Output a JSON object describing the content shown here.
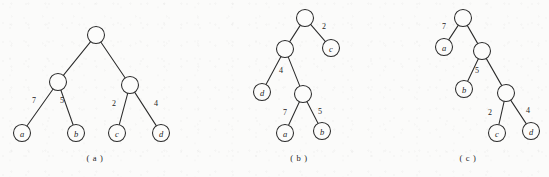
{
  "figure": {
    "type": "binary-tree-diagram",
    "background_color": "#fbfbfa",
    "ink_color": "#2b2b2b",
    "node_radius": 8.5,
    "subfigures": [
      {
        "id": "a",
        "caption": "( a )",
        "caption_pos": {
          "x": 95,
          "y": 158
        },
        "nodes": [
          {
            "id": "a-root",
            "label": "",
            "x": 96,
            "y": 35,
            "kind": "internal"
          },
          {
            "id": "a-n1",
            "label": "",
            "x": 58,
            "y": 82,
            "kind": "internal"
          },
          {
            "id": "a-n2",
            "label": "",
            "x": 130,
            "y": 85,
            "kind": "internal"
          },
          {
            "id": "a-leaf-a",
            "label": "a",
            "x": 22,
            "y": 133,
            "kind": "leaf"
          },
          {
            "id": "a-leaf-b",
            "label": "b",
            "x": 76,
            "y": 133,
            "kind": "leaf"
          },
          {
            "id": "a-leaf-c",
            "label": "c",
            "x": 117,
            "y": 133,
            "kind": "leaf"
          },
          {
            "id": "a-leaf-d",
            "label": "d",
            "x": 161,
            "y": 133,
            "kind": "leaf"
          }
        ],
        "edges": [
          {
            "from": "a-root",
            "to": "a-n1",
            "weight": "",
            "wx": 0,
            "wy": 0
          },
          {
            "from": "a-root",
            "to": "a-n2",
            "weight": "",
            "wx": 0,
            "wy": 0
          },
          {
            "from": "a-n1",
            "to": "a-leaf-a",
            "weight": "7",
            "wx": 34,
            "wy": 100
          },
          {
            "from": "a-n1",
            "to": "a-leaf-b",
            "weight": "5",
            "wx": 62,
            "wy": 100
          },
          {
            "from": "a-n2",
            "to": "a-leaf-c",
            "weight": "2",
            "wx": 114,
            "wy": 103
          },
          {
            "from": "a-n2",
            "to": "a-leaf-d",
            "weight": "4",
            "wx": 156,
            "wy": 103
          }
        ]
      },
      {
        "id": "b",
        "caption": "( b )",
        "caption_pos": {
          "x": 299,
          "y": 158
        },
        "nodes": [
          {
            "id": "b-root",
            "label": "",
            "x": 305,
            "y": 18,
            "kind": "internal"
          },
          {
            "id": "b-n1",
            "label": "",
            "x": 285,
            "y": 49,
            "kind": "internal"
          },
          {
            "id": "b-n2",
            "label": "",
            "x": 303,
            "y": 94,
            "kind": "internal"
          },
          {
            "id": "b-leaf-c",
            "label": "c",
            "x": 331,
            "y": 48,
            "kind": "leaf"
          },
          {
            "id": "b-leaf-d",
            "label": "d",
            "x": 262,
            "y": 92,
            "kind": "leaf"
          },
          {
            "id": "b-leaf-a",
            "label": "a",
            "x": 285,
            "y": 133,
            "kind": "leaf"
          },
          {
            "id": "b-leaf-b",
            "label": "b",
            "x": 322,
            "y": 131,
            "kind": "leaf"
          }
        ],
        "edges": [
          {
            "from": "b-root",
            "to": "b-n1",
            "weight": "",
            "wx": 0,
            "wy": 0
          },
          {
            "from": "b-root",
            "to": "b-leaf-c",
            "weight": "2",
            "wx": 324,
            "wy": 26
          },
          {
            "from": "b-n1",
            "to": "b-leaf-d",
            "weight": "4",
            "wx": 281,
            "wy": 70
          },
          {
            "from": "b-n1",
            "to": "b-n2",
            "weight": "",
            "wx": 0,
            "wy": 0
          },
          {
            "from": "b-n2",
            "to": "b-leaf-a",
            "weight": "7",
            "wx": 285,
            "wy": 112
          },
          {
            "from": "b-n2",
            "to": "b-leaf-b",
            "weight": "5",
            "wx": 320,
            "wy": 111
          }
        ]
      },
      {
        "id": "c",
        "caption": "( c )",
        "caption_pos": {
          "x": 468,
          "y": 158
        },
        "nodes": [
          {
            "id": "c-root",
            "label": "",
            "x": 463,
            "y": 18,
            "kind": "internal"
          },
          {
            "id": "c-n1",
            "label": "",
            "x": 482,
            "y": 51,
            "kind": "internal"
          },
          {
            "id": "c-n2",
            "label": "",
            "x": 506,
            "y": 93,
            "kind": "internal"
          },
          {
            "id": "c-leaf-a",
            "label": "a",
            "x": 444,
            "y": 47,
            "kind": "leaf"
          },
          {
            "id": "c-leaf-b",
            "label": "b",
            "x": 464,
            "y": 89,
            "kind": "leaf"
          },
          {
            "id": "c-leaf-c",
            "label": "c",
            "x": 497,
            "y": 133,
            "kind": "leaf"
          },
          {
            "id": "c-leaf-d",
            "label": "d",
            "x": 531,
            "y": 131,
            "kind": "leaf"
          }
        ],
        "edges": [
          {
            "from": "c-root",
            "to": "c-leaf-a",
            "weight": "7",
            "wx": 444,
            "wy": 26
          },
          {
            "from": "c-root",
            "to": "c-n1",
            "weight": "",
            "wx": 0,
            "wy": 0
          },
          {
            "from": "c-n1",
            "to": "c-leaf-b",
            "weight": "5",
            "wx": 477,
            "wy": 70
          },
          {
            "from": "c-n1",
            "to": "c-n2",
            "weight": "",
            "wx": 0,
            "wy": 0
          },
          {
            "from": "c-n2",
            "to": "c-leaf-c",
            "weight": "2",
            "wx": 490,
            "wy": 112
          },
          {
            "from": "c-n2",
            "to": "c-leaf-d",
            "weight": "4",
            "wx": 528,
            "wy": 110
          }
        ]
      }
    ]
  }
}
